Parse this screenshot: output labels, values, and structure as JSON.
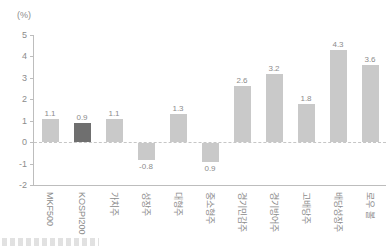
{
  "chart_data": {
    "type": "bar",
    "title": "",
    "unit": "(%)",
    "categories": [
      "MKF500",
      "KOSPI200",
      "가치주",
      "성장주",
      "대형주",
      "중소형주",
      "경기민감주",
      "경기방어주",
      "고배당주",
      "배당성장주",
      "로우 볼"
    ],
    "values": [
      1.1,
      0.9,
      1.1,
      -0.8,
      1.3,
      -0.9,
      2.6,
      3.2,
      1.8,
      4.3,
      3.6
    ],
    "value_labels": [
      "1.1",
      "0.9",
      "1.1",
      "-0.8",
      "1.3",
      "0.9",
      "2.6",
      "3.2",
      "1.8",
      "4.3",
      "3.6"
    ],
    "highlight_index": 1,
    "highlighted_category": "KOSPI200",
    "ylim": [
      -2,
      5
    ],
    "yticks": [
      5,
      4,
      3,
      2,
      1,
      0,
      -1,
      -2
    ],
    "grid": false,
    "zero_line": "dashed",
    "legend": "none",
    "x_label_rotation_deg": 90,
    "caption_partially_cut_off": true
  },
  "colors": {
    "bar": "#c9c9c9",
    "highlight_bar": "#6f6f6f",
    "axis_line": "#bdbdbd",
    "text": "#8c8c8c",
    "background": "#ffffff"
  }
}
